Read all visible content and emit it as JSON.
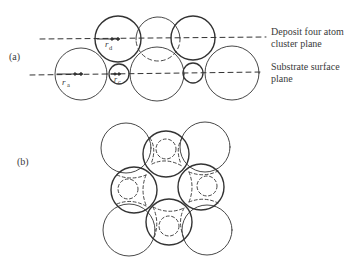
{
  "figure": {
    "panel_a": {
      "label": "(a)",
      "annotations": {
        "deposit_line1": "Deposit four atom",
        "deposit_line2": "cluster plane",
        "substrate_line1": "Substrate surface",
        "substrate_line2": "plane"
      },
      "symbols": {
        "ra": "r",
        "ra_sub": "a",
        "rd": "r",
        "rd_sub": "d",
        "rc": "r",
        "rc_sub": "c"
      }
    },
    "panel_b": {
      "label": "(b)"
    },
    "colors": {
      "stroke": "#333333",
      "background": "#ffffff"
    }
  }
}
